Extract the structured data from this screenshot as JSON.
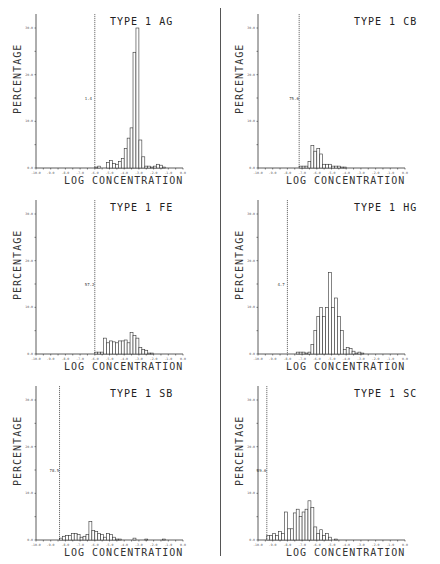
{
  "figure": {
    "y_axis_label": "PERCENTAGE",
    "x_axis_label": "LOG CONCENTRATION"
  },
  "chart_data": [
    {
      "type": "bar",
      "title": "TYPE 1 AG",
      "xlabel": "LOG CONCENTRATION",
      "ylabel": "PERCENTAGE",
      "xlim": [
        -10.0,
        0.0
      ],
      "ylim": [
        0,
        30
      ],
      "y_ticks": [
        "0.0",
        "10.0",
        "20.0",
        "30.0"
      ],
      "x_ticks": [
        "-10.0",
        "-9.0",
        "-8.0",
        "-7.0",
        "-6.0",
        "-5.0",
        "-4.0",
        "-3.0",
        "-2.0",
        "-1.0",
        "0.0"
      ],
      "detection_limit_x": -6.0,
      "detection_limit_label": "1.4",
      "bin_width": 0.2,
      "bins_start": -6.0,
      "values": [
        0.2,
        0.4,
        0,
        0,
        1.2,
        1.6,
        1.0,
        0.8,
        1.4,
        2.0,
        4.2,
        6.4,
        8.6,
        24.8,
        30.0,
        6.0,
        2.4,
        0.4,
        0.4,
        0.2,
        0.4,
        0.8,
        0.6,
        0.2,
        0,
        0
      ]
    },
    {
      "type": "bar",
      "title": "TYPE 1 CB",
      "xlabel": "LOG CONCENTRATION",
      "ylabel": "PERCENTAGE",
      "xlim": [
        -10.0,
        0.0
      ],
      "ylim": [
        0,
        30
      ],
      "y_ticks": [
        "0.0",
        "10.0",
        "20.0",
        "30.0"
      ],
      "x_ticks": [
        "-10.0",
        "-9.0",
        "-8.0",
        "-7.0",
        "-6.0",
        "-5.0",
        "-4.0",
        "-3.0",
        "-2.0",
        "-1.0",
        "0.0"
      ],
      "detection_limit_x": -7.2,
      "detection_limit_label": "75.6",
      "bin_width": 0.2,
      "bins_start": -7.2,
      "values": [
        0.4,
        0.4,
        0.4,
        1.4,
        4.8,
        3.6,
        4.2,
        3.0,
        0.8,
        0.8,
        0.8,
        0.4,
        0.4,
        0.4,
        0.2,
        0.2,
        0,
        0
      ]
    },
    {
      "type": "bar",
      "title": "TYPE 1 FE",
      "xlabel": "LOG CONCENTRATION",
      "ylabel": "PERCENTAGE",
      "xlim": [
        -10.0,
        0.0
      ],
      "ylim": [
        0,
        30
      ],
      "y_ticks": [
        "0.0",
        "10.0",
        "20.0",
        "30.0"
      ],
      "x_ticks": [
        "-10.0",
        "-9.0",
        "-8.0",
        "-7.0",
        "-6.0",
        "-5.0",
        "-4.0",
        "-3.0",
        "-2.0",
        "-1.0",
        "0.0"
      ],
      "detection_limit_x": -6.0,
      "detection_limit_label": "57.2",
      "bin_width": 0.2,
      "bins_start": -6.0,
      "values": [
        0.4,
        0.4,
        0.4,
        3.4,
        2.4,
        2.8,
        2.6,
        2.4,
        2.8,
        2.8,
        3.0,
        2.4,
        4.6,
        4.0,
        3.4,
        1.4,
        1.0,
        0.8,
        0.2,
        0.2,
        0,
        0
      ]
    },
    {
      "type": "bar",
      "title": "TYPE 1 HG",
      "xlabel": "LOG CONCENTRATION",
      "ylabel": "PERCENTAGE",
      "xlim": [
        -10.0,
        0.0
      ],
      "ylim": [
        0,
        30
      ],
      "y_ticks": [
        "0.0",
        "10.0",
        "20.0",
        "30.0"
      ],
      "x_ticks": [
        "-10.0",
        "-9.0",
        "-8.0",
        "-7.0",
        "-6.0",
        "-5.0",
        "-4.0",
        "-3.0",
        "-2.0",
        "-1.0",
        "0.0"
      ],
      "detection_limit_x": -8.0,
      "detection_limit_label": "4.7",
      "bin_width": 0.2,
      "bins_start": -8.0,
      "values": [
        0,
        0,
        0,
        0.4,
        0.4,
        0.4,
        0.2,
        0.4,
        2.0,
        5.0,
        8.0,
        10.0,
        8.0,
        10.0,
        17.5,
        10.0,
        12.0,
        8.0,
        5.0,
        1.0,
        1.4,
        1.2,
        0.6,
        0.2,
        0.4,
        0.2,
        0
      ]
    },
    {
      "type": "bar",
      "title": "TYPE 1 SB",
      "xlabel": "LOG CONCENTRATION",
      "ylabel": "PERCENTAGE",
      "xlim": [
        -10.0,
        0.0
      ],
      "ylim": [
        0,
        30
      ],
      "y_ticks": [
        "0.0",
        "10.0",
        "20.0",
        "30.0"
      ],
      "x_ticks": [
        "-10.0",
        "-9.0",
        "-8.0",
        "-7.0",
        "-6.0",
        "-5.0",
        "-4.0",
        "-3.0",
        "-2.0",
        "-1.0",
        "0.0"
      ],
      "detection_limit_x": -8.4,
      "detection_limit_label": "78.5",
      "bin_width": 0.2,
      "bins_start": -8.4,
      "values": [
        0.4,
        0.8,
        1.0,
        1.0,
        1.4,
        1.4,
        1.2,
        0.6,
        0.8,
        1.2,
        4.0,
        2.0,
        1.8,
        1.4,
        1.2,
        0.6,
        1.4,
        1.2,
        0.6,
        0.2,
        0.2,
        0,
        0,
        0,
        0,
        0.4,
        0,
        0,
        0,
        0.2,
        0,
        0,
        0,
        0,
        0,
        0.2
      ]
    },
    {
      "type": "bar",
      "title": "TYPE 1 SC",
      "xlabel": "LOG CONCENTRATION",
      "ylabel": "PERCENTAGE",
      "xlim": [
        -10.0,
        0.0
      ],
      "ylim": [
        0,
        30
      ],
      "y_ticks": [
        "0.0",
        "10.0",
        "20.0",
        "30.0"
      ],
      "x_ticks": [
        "-10.0",
        "-9.0",
        "-8.0",
        "-7.0",
        "-6.0",
        "-5.0",
        "-4.0",
        "-3.0",
        "-2.0",
        "-1.0",
        "0.0"
      ],
      "detection_limit_x": -9.4,
      "detection_limit_label": "89.6",
      "bin_width": 0.2,
      "bins_start": -9.4,
      "values": [
        1.0,
        1.0,
        1.4,
        1.0,
        1.8,
        1.4,
        6.0,
        2.4,
        2.4,
        5.8,
        6.6,
        5.0,
        6.0,
        6.6,
        8.4,
        7.0,
        2.8,
        1.4,
        2.2,
        1.0,
        1.4,
        0.6,
        0,
        0.2
      ]
    }
  ]
}
